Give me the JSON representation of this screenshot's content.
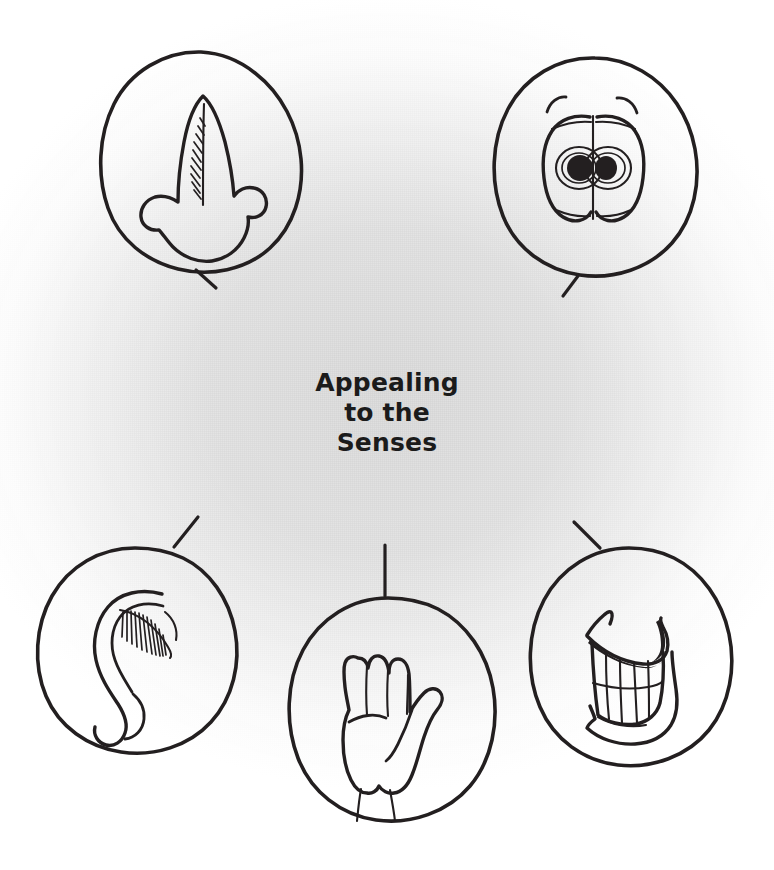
{
  "page": {
    "title": "Appealing to the Senses",
    "kind": "hand-drawn illustration",
    "background_color": "#ffffff",
    "paper_tone_color": "#e4e4e4",
    "ink_color": "#231f20",
    "width": 774,
    "height": 870
  },
  "caption": {
    "line1": "Appealing",
    "line2": "to the",
    "line3": "Senses"
  },
  "figures": [
    {
      "id": "smell",
      "label": "nose",
      "sense": "smell",
      "position": "top-left",
      "tail_direction": "down-right"
    },
    {
      "id": "sight",
      "label": "eyes",
      "sense": "sight",
      "position": "top-right",
      "tail_direction": "down-left"
    },
    {
      "id": "hearing",
      "label": "ear",
      "sense": "hearing",
      "position": "bottom-left",
      "tail_direction": "up-right"
    },
    {
      "id": "touch",
      "label": "hand",
      "sense": "touch",
      "position": "bottom-center",
      "tail_direction": "up"
    },
    {
      "id": "taste",
      "label": "mouth",
      "sense": "taste",
      "position": "bottom-right",
      "tail_direction": "up-left"
    }
  ]
}
